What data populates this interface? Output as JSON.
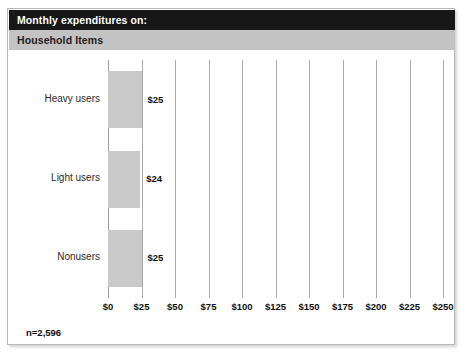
{
  "header": {
    "primary_title": "Monthly expenditures on:",
    "secondary_title": "Household Items",
    "primary_bg": "#171717",
    "secondary_bg": "#c3c3c3"
  },
  "footnote": "n=2,596",
  "chart_data": {
    "type": "bar",
    "orientation": "horizontal",
    "title": "Monthly expenditures on:",
    "subtitle": "Household Items",
    "categories": [
      "Heavy users",
      "Light users",
      "Nonusers"
    ],
    "values": [
      25,
      24,
      25
    ],
    "value_labels": [
      "$25",
      "$24",
      "$25"
    ],
    "xlabel": "",
    "ylabel": "",
    "xlim": [
      0,
      250
    ],
    "xticks": [
      0,
      25,
      50,
      75,
      100,
      125,
      150,
      175,
      200,
      225,
      250
    ],
    "xtick_labels": [
      "$0",
      "$25",
      "$50",
      "$75",
      "$100",
      "$125",
      "$150",
      "$175",
      "$200",
      "$225",
      "$250"
    ],
    "grid": true,
    "grid_axis": "x",
    "legend": false,
    "bar_color": "#c9c9c9",
    "sample_size_note": "n=2,596"
  }
}
